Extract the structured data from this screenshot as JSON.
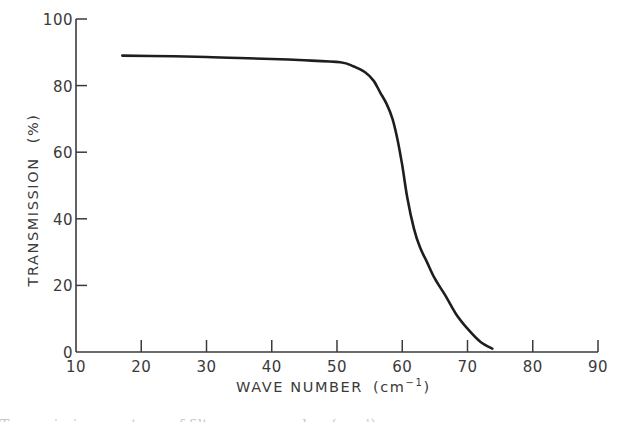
{
  "chart_data": {
    "type": "line",
    "title": "",
    "xlabel": "WAVE NUMBER (cm⁻¹)",
    "xlabel_main": "WAVE NUMBER",
    "xlabel_unit_open": "(cm",
    "xlabel_unit_sup": "−1",
    "xlabel_unit_close": ")",
    "ylabel": "TRANSMISSION (%)",
    "xlim": [
      10,
      90
    ],
    "ylim": [
      0,
      100
    ],
    "xticks": [
      10,
      20,
      30,
      40,
      50,
      60,
      70,
      80,
      90
    ],
    "yticks": [
      0,
      20,
      40,
      60,
      80,
      100
    ],
    "grid": false,
    "legend": null,
    "series": [
      {
        "name": "transmission",
        "color": "#1e1e1e",
        "x": [
          17.1,
          25,
          30,
          35,
          40,
          45,
          50.5,
          52.5,
          54.3,
          55.6,
          56.6,
          57.6,
          58.5,
          59.3,
          60.0,
          60.8,
          61.8,
          62.7,
          63.8,
          65.0,
          66.6,
          68.2,
          70.0,
          72.0,
          73.8
        ],
        "y": [
          89.0,
          88.8,
          88.6,
          88.3,
          88.0,
          87.6,
          87.0,
          85.8,
          84.0,
          81.5,
          78.0,
          74.5,
          70.0,
          63.5,
          56.0,
          46.0,
          37.0,
          31.5,
          27.0,
          22.0,
          17.0,
          11.5,
          7.0,
          3.0,
          1.0
        ]
      }
    ]
  },
  "axes": {
    "y_title": "TRANSMISSION",
    "y_unit": "(%)"
  },
  "caption": {
    "text": "Transmission spectrum of filter, wave number (cm⁻¹)"
  }
}
